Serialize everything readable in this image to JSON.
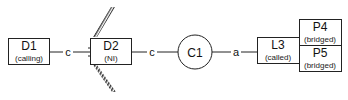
{
  "diagram": {
    "nodes": [
      {
        "id": "D1",
        "label": "D1",
        "sublabel": "(calling)",
        "shape": "rect"
      },
      {
        "id": "D2",
        "label": "D2",
        "sublabel": "(NI)",
        "shape": "rect",
        "decoration": "hatched-barrier"
      },
      {
        "id": "C1",
        "label": "C1",
        "sublabel": "",
        "shape": "circle"
      },
      {
        "id": "L3",
        "label": "L3",
        "sublabel": "(called)",
        "shape": "rect"
      },
      {
        "id": "P4",
        "label": "P4",
        "sublabel": "(bridged)",
        "shape": "rect"
      },
      {
        "id": "P5",
        "label": "P5",
        "sublabel": "(bridged)",
        "shape": "rect"
      }
    ],
    "edges": [
      {
        "from": "D1",
        "to": "D2",
        "label": "c"
      },
      {
        "from": "D2",
        "to": "C1",
        "label": "c"
      },
      {
        "from": "C1",
        "to": "L3",
        "label": "a"
      },
      {
        "from": "L3",
        "to": "P4",
        "label": ""
      },
      {
        "from": "L3",
        "to": "P5",
        "label": ""
      }
    ],
    "colors": {
      "stroke": "#222222",
      "background": "#ffffff",
      "hatch": "#333333"
    }
  }
}
